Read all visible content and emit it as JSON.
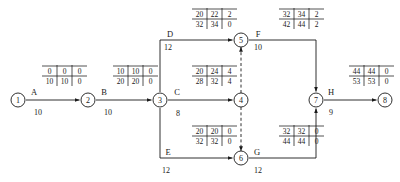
{
  "diagram": {
    "type": "network-cpm",
    "nodes": [
      {
        "id": "1",
        "label": "1",
        "x": 18,
        "y": 100
      },
      {
        "id": "2",
        "label": "2",
        "x": 88,
        "y": 100
      },
      {
        "id": "3",
        "label": "3",
        "x": 160,
        "y": 100
      },
      {
        "id": "4",
        "label": "4",
        "x": 241,
        "y": 100
      },
      {
        "id": "5",
        "label": "5",
        "x": 241,
        "y": 40
      },
      {
        "id": "6",
        "label": "6",
        "x": 241,
        "y": 158
      },
      {
        "id": "7",
        "label": "7",
        "x": 316,
        "y": 100
      },
      {
        "id": "8",
        "label": "8",
        "x": 385,
        "y": 100
      }
    ],
    "node_radius": 7,
    "activities": [
      {
        "name": "A",
        "duration": "10",
        "from": "1",
        "to": "2",
        "label_x": 34,
        "label_y": 92,
        "dur_x": 38,
        "dur_y": 112,
        "table": {
          "x": 42,
          "y": 66,
          "es": "0",
          "ef": "0",
          "tf": "0",
          "ls": "10",
          "lf": "10",
          "ff": "0"
        }
      },
      {
        "name": "B",
        "duration": "10",
        "from": "2",
        "to": "3",
        "label_x": 104,
        "label_y": 92,
        "dur_x": 108,
        "dur_y": 112,
        "table": {
          "x": 113,
          "y": 66,
          "es": "10",
          "ef": "10",
          "tf": "0",
          "ls": "20",
          "lf": "20",
          "ff": "0"
        }
      },
      {
        "name": "C",
        "duration": "8",
        "from": "3",
        "to": "4",
        "label_x": 177,
        "label_y": 92,
        "dur_x": 178,
        "dur_y": 113,
        "table": {
          "x": 192,
          "y": 66,
          "es": "20",
          "ef": "24",
          "tf": "4",
          "ls": "28",
          "lf": "32",
          "ff": "4"
        }
      },
      {
        "name": "D",
        "duration": "12",
        "from": "3",
        "to": "5",
        "label_x": 170,
        "label_y": 34,
        "dur_x": 168,
        "dur_y": 47,
        "table": {
          "x": 192,
          "y": 9,
          "es": "20",
          "ef": "22",
          "tf": "2",
          "ls": "32",
          "lf": "34",
          "ff": "0"
        }
      },
      {
        "name": "E",
        "duration": "12",
        "from": "3",
        "to": "6",
        "label_x": 168,
        "label_y": 152,
        "dur_x": 166,
        "dur_y": 170,
        "table": {
          "x": 192,
          "y": 126,
          "es": "20",
          "ef": "20",
          "tf": "0",
          "ls": "32",
          "lf": "32",
          "ff": "0"
        }
      },
      {
        "name": "F",
        "duration": "10",
        "from": "5",
        "to": "7",
        "label_x": 258,
        "label_y": 34,
        "dur_x": 258,
        "dur_y": 47,
        "table": {
          "x": 279,
          "y": 9,
          "es": "32",
          "ef": "34",
          "tf": "2",
          "ls": "42",
          "lf": "44",
          "ff": "2"
        }
      },
      {
        "name": "G",
        "duration": "12",
        "from": "6",
        "to": "7",
        "label_x": 257,
        "label_y": 152,
        "dur_x": 258,
        "dur_y": 170,
        "table": {
          "x": 279,
          "y": 126,
          "es": "32",
          "ef": "32",
          "tf": "0",
          "ls": "44",
          "lf": "44",
          "ff": "0"
        }
      },
      {
        "name": "H",
        "duration": "9",
        "from": "7",
        "to": "8",
        "label_x": 331,
        "label_y": 92,
        "dur_x": 331,
        "dur_y": 112,
        "table": {
          "x": 349,
          "y": 66,
          "es": "44",
          "ef": "44",
          "tf": "0",
          "ls": "53",
          "lf": "53",
          "ff": "0"
        }
      }
    ],
    "dummies": [
      {
        "from": "4",
        "to": "5",
        "x": 241,
        "y1": 93,
        "y2": 47,
        "direction": "up"
      },
      {
        "from": "4",
        "to": "6",
        "x": 241,
        "y1": 107,
        "y2": 151,
        "direction": "down"
      }
    ]
  }
}
